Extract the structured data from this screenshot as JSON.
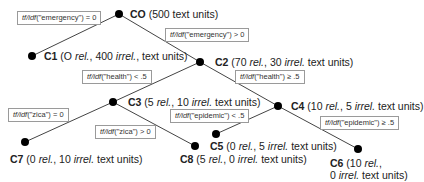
{
  "tree": {
    "metric": "tf/idf",
    "nodes": [
      {
        "id": "C0",
        "name": "CO",
        "text": "(500 text units)",
        "x": 119,
        "y": 14
      },
      {
        "id": "C1",
        "name": "C1",
        "prefix": "(O ",
        "rel": "rel.",
        "mid": ", 400 ",
        "irrel": "irrel.",
        "suffix": ", text units)",
        "x": 32,
        "y": 56
      },
      {
        "id": "C2",
        "name": "C2",
        "prefix": "(70 ",
        "rel": "rel.",
        "mid": ", 30 ",
        "irrel": "irrel.",
        "suffix": " text units)",
        "x": 200,
        "y": 62
      },
      {
        "id": "C3",
        "name": "C3",
        "prefix": "(5 ",
        "rel": "rel.",
        "mid": ", 10 ",
        "irrel": "irrel.",
        "suffix": " text units)",
        "x": 113,
        "y": 102
      },
      {
        "id": "C4",
        "name": "C4",
        "prefix": "(10 ",
        "rel": "rel.",
        "mid": ", 5 ",
        "irrel": "irrel.",
        "suffix": " text units)",
        "x": 278,
        "y": 106
      },
      {
        "id": "C5",
        "name": "C5",
        "prefix": "(0 ",
        "rel": "rel.",
        "mid": ", 5 ",
        "irrel": "irrel.",
        "suffix": " text units)",
        "x": 216,
        "y": 134
      },
      {
        "id": "C6",
        "name": "C6",
        "prefix": "(10 ",
        "rel": "rel.",
        "mid": ",",
        "line2_prefix": "0 ",
        "irrel": "irrel.",
        "suffix": "  text units)",
        "x": 358,
        "y": 149
      },
      {
        "id": "C7",
        "name": "C7",
        "prefix": "(0 ",
        "rel": "rel.",
        "mid": ", 10 ",
        "irrel": "irrel.",
        "suffix": " text units)",
        "x": 25,
        "y": 142
      },
      {
        "id": "C8",
        "name": "C8",
        "prefix": "(5 ",
        "rel": "rel.",
        "mid": ",  0 ",
        "irrel": "irrel.",
        "suffix": " text units)",
        "x": 195,
        "y": 146
      }
    ],
    "edges": [
      {
        "from": "C0",
        "to": "C1",
        "term": "\"emergency\"",
        "op": ") = 0"
      },
      {
        "from": "C0",
        "to": "C2",
        "term": "\"emergency\"",
        "op": ") > 0"
      },
      {
        "from": "C2",
        "to": "C3",
        "term": "\"health\"",
        "op": ") < .5"
      },
      {
        "from": "C2",
        "to": "C4",
        "term": "\"health\"",
        "op": ") ≥ .5"
      },
      {
        "from": "C3",
        "to": "C7",
        "term": "\"zica\"",
        "op": ") = 0"
      },
      {
        "from": "C3",
        "to": "C8",
        "term": "\"zica\"",
        "op": ") > 0"
      },
      {
        "from": "C4",
        "to": "C5",
        "term": "\"epidemic\"",
        "op": ") < .5"
      },
      {
        "from": "C4",
        "to": "C6",
        "term": "\"epidemic\"",
        "op": ") ≥ .5"
      }
    ]
  }
}
